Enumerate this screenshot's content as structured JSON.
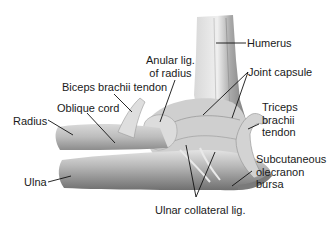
{
  "figure": {
    "labels": {
      "humerus": "Humerus",
      "anular_lig": [
        "Anular lig.",
        "of radius"
      ],
      "joint_capsule": "Joint capsule",
      "biceps_tendon": "Biceps brachii tendon",
      "oblique_cord": "Oblique cord",
      "radius": "Radius",
      "triceps_tendon": [
        "Triceps",
        "brachii",
        "tendon"
      ],
      "ulna": "Ulna",
      "olecranon_bursa": [
        "Subcutaneous",
        "olecranon",
        "bursa"
      ],
      "ulnar_collateral": "Ulnar collateral lig."
    }
  },
  "colors": {
    "background": "#ffffff",
    "bone_light": "#e6e6e6",
    "bone_mid": "#bdbdbd",
    "bone_dark": "#8a8a8a",
    "leader_line": "#111111",
    "text": "#1a1a1a"
  }
}
